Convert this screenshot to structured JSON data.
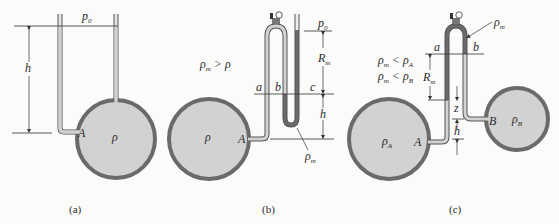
{
  "figure": {
    "panels": [
      {
        "id": "a",
        "caption": "(a)",
        "labels": {
          "pressure_top": "p",
          "pressure_top_sub": "0",
          "height": "h",
          "point": "A",
          "density": "ρ"
        }
      },
      {
        "id": "b",
        "caption": "(b)",
        "labels": {
          "condition": "ρ",
          "condition_sub": "m",
          "condition_rel": " > ρ",
          "pressure_top": "p",
          "pressure_top_sub": "0",
          "reading": "R",
          "reading_sub": "m",
          "height": "h",
          "level_a": "a",
          "level_b": "b",
          "level_c": "c",
          "point": "A",
          "density": "ρ",
          "manometer_fluid": "ρ",
          "manometer_fluid_sub": "m"
        }
      },
      {
        "id": "c",
        "caption": "(c)",
        "labels": {
          "condition1": "ρ",
          "condition1_sub": "m",
          "condition1_rel": " < ρ",
          "condition1_rel_sub": "A",
          "condition2": "ρ",
          "condition2_sub": "m",
          "condition2_rel": " < ρ",
          "condition2_rel_sub": "B",
          "manometer_fluid": "ρ",
          "manometer_fluid_sub": "m",
          "level_a": "a",
          "level_b": "b",
          "reading": "R",
          "reading_sub": "m",
          "z": "z",
          "height": "h",
          "point_A": "A",
          "point_B": "B",
          "density_A": "ρ",
          "density_A_sub": "A",
          "density_B": "ρ",
          "density_B_sub": "B"
        }
      }
    ],
    "colors": {
      "vessel_wall": "#6a6a6a",
      "fluid": "#d2d2d2",
      "manometer_fluid": "#6a6a6a",
      "lines": "#333333"
    }
  }
}
